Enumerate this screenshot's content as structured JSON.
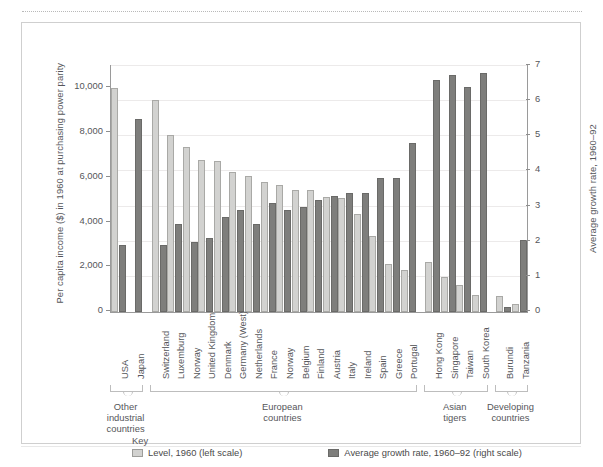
{
  "chart_data": {
    "type": "bar",
    "title": "",
    "xlabel": "",
    "ylabel": "Per capita income ($) in 1960 at purchasing power parity",
    "y2label": "Average growth rate, 1960–92",
    "ylim": [
      0,
      11000
    ],
    "y2lim": [
      0,
      7
    ],
    "yticks": [
      "0",
      "2,000",
      "4,000",
      "6,000",
      "8,000",
      "10,000"
    ],
    "ytick_values": [
      0,
      2000,
      4000,
      6000,
      8000,
      10000
    ],
    "y2ticks": [
      "0",
      "1",
      "2",
      "3",
      "4",
      "5",
      "6",
      "7"
    ],
    "y2tick_values": [
      0,
      1,
      2,
      3,
      4,
      5,
      6,
      7
    ],
    "grid": true,
    "legend_position": "bottom",
    "categories": [
      "USA",
      "Japan",
      "Switzerland",
      "Luxemburg",
      "Norway",
      "United Kingdom",
      "Denmark",
      "Germany (West)",
      "Netherlands",
      "France",
      "Norway",
      "Belgium",
      "Finland",
      "Austria",
      "Italy",
      "Ireland",
      "Spain",
      "Greece",
      "Portugal",
      "Hong Kong",
      "Singapore",
      "Taiwan",
      "South Korea",
      "Burundi",
      "Tanzania"
    ],
    "series": [
      {
        "name": "Level, 1960 (left scale)",
        "scale": "left",
        "color": "#d2d2d0",
        "values": [
          10000,
          0,
          9500,
          7900,
          7400,
          6800,
          6750,
          6250,
          6100,
          5800,
          5700,
          5450,
          5450,
          5150,
          5100,
          4400,
          3400,
          2150,
          1900,
          2250,
          1550,
          1200,
          750,
          700,
          350
        ]
      },
      {
        "name": "Average growth rate, 1960–92 (right scale)",
        "scale": "right",
        "color": "#7e7e7c",
        "values": [
          1.9,
          5.5,
          1.9,
          2.5,
          2.0,
          2.1,
          2.7,
          2.9,
          2.5,
          3.1,
          2.9,
          3.0,
          3.2,
          3.3,
          3.4,
          3.4,
          3.8,
          3.8,
          4.8,
          6.6,
          6.75,
          6.4,
          6.8,
          0.15,
          2.05
        ]
      }
    ],
    "groups": [
      {
        "label": "Other\nindustrial\ncountries",
        "from": 0,
        "to": 1
      },
      {
        "label": "European\ncountries",
        "from": 2,
        "to": 18
      },
      {
        "label": "Asian\ntigers",
        "from": 19,
        "to": 22
      },
      {
        "label": "Developing\ncountries",
        "from": 23,
        "to": 24
      }
    ]
  },
  "key": {
    "title": "Key",
    "items": [
      {
        "label": "Level, 1960 (left scale)",
        "swatch": "level"
      },
      {
        "label": "Average growth rate, 1960–92 (right scale)",
        "swatch": "growth"
      }
    ]
  },
  "group_labels": {
    "other_industrial_l1": "Other",
    "other_industrial_l2": "industrial",
    "other_industrial_l3": "countries",
    "european_l1": "European",
    "european_l2": "countries",
    "asian_l1": "Asian",
    "asian_l2": "tigers",
    "developing_l1": "Developing",
    "developing_l2": "countries"
  }
}
